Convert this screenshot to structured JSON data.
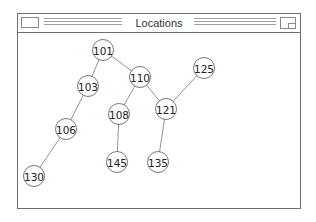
{
  "window": {
    "title": "Locations"
  },
  "graph": {
    "type": "tree",
    "nodes": [
      {
        "id": "101",
        "label": "101",
        "x": 103,
        "y": 50
      },
      {
        "id": "103",
        "label": "103",
        "x": 88,
        "y": 86
      },
      {
        "id": "110",
        "label": "110",
        "x": 140,
        "y": 77
      },
      {
        "id": "125",
        "label": "125",
        "x": 204,
        "y": 68
      },
      {
        "id": "106",
        "label": "106",
        "x": 66,
        "y": 129
      },
      {
        "id": "108",
        "label": "108",
        "x": 119,
        "y": 114
      },
      {
        "id": "121",
        "label": "121",
        "x": 166,
        "y": 109
      },
      {
        "id": "130",
        "label": "130",
        "x": 34,
        "y": 176
      },
      {
        "id": "145",
        "label": "145",
        "x": 117,
        "y": 162
      },
      {
        "id": "135",
        "label": "135",
        "x": 158,
        "y": 162
      }
    ],
    "edges": [
      [
        "101",
        "103"
      ],
      [
        "101",
        "110"
      ],
      [
        "103",
        "106"
      ],
      [
        "106",
        "130"
      ],
      [
        "110",
        "108"
      ],
      [
        "110",
        "121"
      ],
      [
        "108",
        "145"
      ],
      [
        "121",
        "135"
      ],
      [
        "121",
        "125"
      ]
    ]
  }
}
